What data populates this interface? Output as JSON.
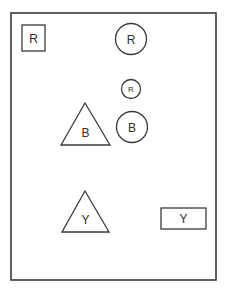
{
  "canvas": {
    "width": 225,
    "height": 293,
    "background": "#ffffff",
    "stroke_color": "#3a3a3a",
    "label_color": "#2e2e2e"
  },
  "frame": {
    "name": "outer-frame",
    "x": 11,
    "y": 13,
    "width": 205,
    "height": 267
  },
  "shapes": [
    {
      "id": "square-r",
      "kind": "square",
      "label": "R",
      "x": 22,
      "y": 25,
      "width": 23,
      "height": 26,
      "font_size": 12
    },
    {
      "id": "circle-r-large",
      "kind": "circle",
      "label": "R",
      "cx": 131,
      "cy": 39,
      "r": 15.5,
      "font_size": 12
    },
    {
      "id": "circle-r-small",
      "kind": "circle",
      "label": "R",
      "cx": 131,
      "cy": 89,
      "r": 9.5,
      "font_size": 8
    },
    {
      "id": "triangle-b",
      "kind": "triangle",
      "label": "B",
      "apex_x": 85,
      "top_y": 103,
      "base_left_x": 61,
      "base_right_x": 110,
      "base_y": 145,
      "font_size": 12
    },
    {
      "id": "circle-b",
      "kind": "circle",
      "label": "B",
      "cx": 132,
      "cy": 127,
      "r": 15.5,
      "font_size": 12
    },
    {
      "id": "triangle-y",
      "kind": "triangle",
      "label": "Y",
      "apex_x": 85,
      "top_y": 191,
      "base_left_x": 62,
      "base_right_x": 109,
      "base_y": 232,
      "font_size": 12
    },
    {
      "id": "rect-y",
      "kind": "rectangle",
      "label": "Y",
      "x": 161,
      "y": 208,
      "width": 45,
      "height": 21,
      "font_size": 12
    }
  ]
}
